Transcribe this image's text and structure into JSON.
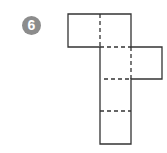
{
  "figure": {
    "number_label": "6",
    "badge_color": "#8c8c8c",
    "line_color": "#333333"
  }
}
